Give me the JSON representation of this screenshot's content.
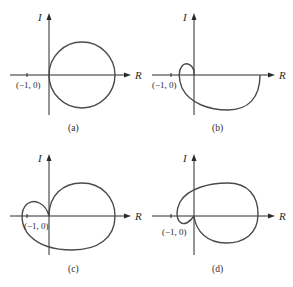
{
  "figure": {
    "panels": [
      {
        "id": "a",
        "caption": "(a)",
        "y_axis_label": "I",
        "x_axis_label": "R",
        "critical_point_label": "(−1, 0)",
        "description": "Nyquist plot: circle to the right of the origin, does not encircle (-1,0)"
      },
      {
        "id": "b",
        "caption": "(b)",
        "y_axis_label": "I",
        "x_axis_label": "R",
        "critical_point_label": "(−1, 0)",
        "description": "Nyquist plot: small loop near origin then large lower semicircle; does not encircle (-1,0)"
      },
      {
        "id": "c",
        "caption": "(c)",
        "y_axis_label": "I",
        "x_axis_label": "R",
        "critical_point_label": "(−1, 0)",
        "description": "Nyquist plot: large lobe plus left loop that encircles (-1,0)"
      },
      {
        "id": "d",
        "caption": "(d)",
        "y_axis_label": "I",
        "x_axis_label": "R",
        "critical_point_label": "(−1, 0)",
        "description": "Nyquist plot: large lobe with small inner loop near origin; does not encircle (-1,0)"
      }
    ]
  }
}
